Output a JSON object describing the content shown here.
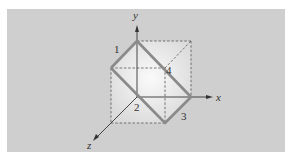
{
  "diagram": {
    "axes": {
      "x": "x",
      "y": "y",
      "z": "z"
    },
    "vertex_labels": [
      "1",
      "2",
      "3",
      "4"
    ],
    "colors": {
      "panel": "#cfcfcf",
      "cube_face": "#eeeeee",
      "highlight_edge": "#8a8a8a",
      "dashed_edge": "#555555",
      "axis": "#333333"
    }
  }
}
